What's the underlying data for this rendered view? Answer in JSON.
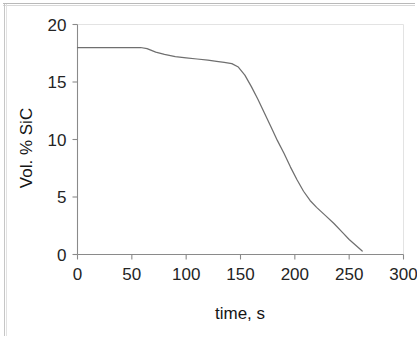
{
  "figure": {
    "name": "vol-percent-sic-vs-time-plot",
    "background_color": "#ffffff",
    "frame_color": "#c6c6c6"
  },
  "chart_data": {
    "type": "line",
    "title": "",
    "subtitle": "",
    "xlabel": "time, s",
    "ylabel": "Vol. % SiC",
    "xlim": [
      0,
      300
    ],
    "ylim": [
      0,
      20
    ],
    "xticks": [
      0,
      50,
      100,
      150,
      200,
      250,
      300
    ],
    "xtick_labels": [
      "0",
      "50",
      "100",
      "150",
      "200",
      "250",
      "300"
    ],
    "yticks": [
      0,
      5,
      10,
      15,
      20
    ],
    "ytick_labels": [
      "0",
      "5",
      "10",
      "15",
      "20"
    ],
    "grid": false,
    "legend": null,
    "legend_position": "none",
    "series": [
      {
        "name": "Vol. % SiC",
        "color": "#6f6f6f",
        "x": [
          0,
          10,
          20,
          30,
          40,
          50,
          58,
          64,
          72,
          80,
          90,
          100,
          110,
          120,
          128,
          135,
          142,
          148,
          154,
          160,
          166,
          172,
          178,
          184,
          190,
          196,
          202,
          208,
          214,
          220,
          228,
          236,
          244,
          250,
          256,
          262
        ],
        "y": [
          18.0,
          18.0,
          18.0,
          18.0,
          18.0,
          18.0,
          18.0,
          17.9,
          17.6,
          17.4,
          17.2,
          17.1,
          17.0,
          16.9,
          16.8,
          16.7,
          16.6,
          16.3,
          15.6,
          14.6,
          13.5,
          12.3,
          11.1,
          9.9,
          8.8,
          7.6,
          6.5,
          5.5,
          4.7,
          4.1,
          3.4,
          2.7,
          1.9,
          1.3,
          0.8,
          0.3
        ]
      }
    ]
  },
  "axes": {
    "y_axis_title": "Vol. % SiC",
    "x_axis_title": "time, s"
  }
}
